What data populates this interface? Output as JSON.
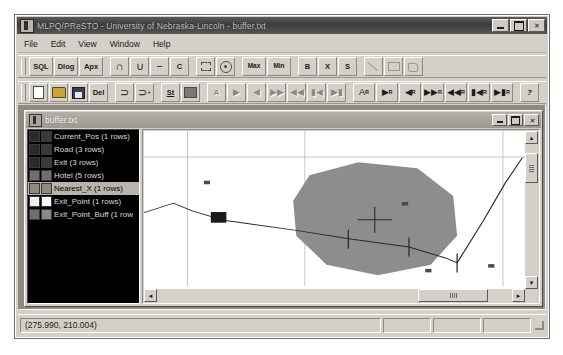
{
  "window": {
    "title": "MLPQ/PReSTO - University of Nebraska-Lincoln - buffer.txt",
    "icon": "app-icon",
    "controls": {
      "minimize": "",
      "maximize": "",
      "close": "✕"
    }
  },
  "menu": {
    "items": [
      "File",
      "Edit",
      "View",
      "Window",
      "Help"
    ]
  },
  "toolbar1": {
    "buttons": [
      {
        "label": "SQL",
        "name": "sql-button",
        "kind": "text",
        "wide": true,
        "disabled": false
      },
      {
        "label": "Dlog",
        "name": "datalog-button",
        "kind": "text",
        "wide": true,
        "disabled": false
      },
      {
        "label": "Apx",
        "name": "approximate-button",
        "kind": "text",
        "wide": true,
        "disabled": false
      },
      {
        "label": "∩",
        "name": "intersection-button",
        "kind": "sym",
        "wide": false,
        "disabled": false
      },
      {
        "label": "∪",
        "name": "union-button",
        "kind": "sym",
        "wide": false,
        "disabled": false
      },
      {
        "label": "−",
        "name": "difference-button",
        "kind": "sym",
        "wide": false,
        "disabled": false
      },
      {
        "label": "C",
        "name": "complement-button",
        "kind": "text",
        "wide": false,
        "disabled": false
      },
      {
        "label": "",
        "name": "select-area-icon",
        "kind": "sel",
        "wide": false,
        "disabled": false
      },
      {
        "label": "",
        "name": "point-circle-icon",
        "kind": "circ",
        "wide": false,
        "disabled": false
      },
      {
        "label": "Max",
        "name": "max-button",
        "kind": "sc",
        "wide": true,
        "disabled": false
      },
      {
        "label": "Min",
        "name": "min-button",
        "kind": "sc",
        "wide": true,
        "disabled": false
      },
      {
        "label": "B",
        "name": "buffer-button",
        "kind": "text",
        "wide": false,
        "disabled": false
      },
      {
        "label": "X",
        "name": "intersect-x-button",
        "kind": "text",
        "wide": false,
        "disabled": false
      },
      {
        "label": "S",
        "name": "shortest-path-button",
        "kind": "text",
        "wide": false,
        "disabled": false
      },
      {
        "label": "",
        "name": "line-tool-icon",
        "kind": "line",
        "wide": false,
        "disabled": true
      },
      {
        "label": "",
        "name": "rectangle-tool-icon",
        "kind": "rect",
        "wide": false,
        "disabled": true
      },
      {
        "label": "",
        "name": "polygon-tool-icon",
        "kind": "poly",
        "wide": false,
        "disabled": true
      }
    ],
    "separators_after": [
      2,
      6,
      8,
      10,
      13
    ]
  },
  "toolbar2": {
    "buttons": [
      {
        "label": "",
        "name": "new-file-icon",
        "kind": "doc",
        "sub": "",
        "disabled": false
      },
      {
        "label": "",
        "name": "open-file-icon",
        "kind": "open",
        "sub": "",
        "disabled": false
      },
      {
        "label": "",
        "name": "save-file-icon",
        "kind": "save",
        "sub": "",
        "disabled": false
      },
      {
        "label": "Del",
        "name": "delete-button",
        "kind": "text",
        "sub": "",
        "disabled": false
      },
      {
        "label": "⊃",
        "name": "curve-tool-icon",
        "kind": "curve",
        "sub": "",
        "disabled": false
      },
      {
        "label": "⊃",
        "name": "add-curve-tool-icon",
        "kind": "curve",
        "sub": "+",
        "disabled": false
      },
      {
        "label": "St",
        "name": "statistics-button",
        "kind": "under",
        "sub": "",
        "disabled": false
      },
      {
        "label": "",
        "name": "color-swatch-icon",
        "kind": "solid",
        "sub": "",
        "disabled": false
      },
      {
        "label": "A",
        "name": "animate-all-button",
        "kind": "text",
        "sub": "",
        "disabled": true
      },
      {
        "label": "▶",
        "name": "play-forward-button",
        "kind": "glyph",
        "sub": "",
        "disabled": true
      },
      {
        "label": "◀",
        "name": "play-backward-button",
        "kind": "glyph",
        "sub": "",
        "disabled": true
      },
      {
        "label": "▶▶",
        "name": "fast-forward-button",
        "kind": "glyph",
        "sub": "",
        "disabled": true
      },
      {
        "label": "◀◀",
        "name": "fast-rewind-button",
        "kind": "glyph",
        "sub": "",
        "disabled": true
      },
      {
        "label": "▮◀",
        "name": "skip-start-button",
        "kind": "glyph",
        "sub": "",
        "disabled": true
      },
      {
        "label": "▶▮",
        "name": "skip-end-button",
        "kind": "glyph",
        "sub": "",
        "disabled": true
      },
      {
        "label": "A",
        "name": "animate-all-rel-button",
        "kind": "rsub",
        "sub": "R",
        "disabled": false
      },
      {
        "label": "▶",
        "name": "play-forward-rel-button",
        "kind": "rsub",
        "sub": "R",
        "disabled": false
      },
      {
        "label": "◀",
        "name": "play-backward-rel-button",
        "kind": "rsub",
        "sub": "R",
        "disabled": false
      },
      {
        "label": "▶▶",
        "name": "fast-forward-rel-button",
        "kind": "rsub",
        "sub": "R",
        "disabled": false
      },
      {
        "label": "◀◀",
        "name": "fast-rewind-rel-button",
        "kind": "rsub",
        "sub": "R",
        "disabled": false
      },
      {
        "label": "▮◀",
        "name": "skip-start-rel-button",
        "kind": "rsub",
        "sub": "R",
        "disabled": false
      },
      {
        "label": "▶▮",
        "name": "skip-end-rel-button",
        "kind": "rsub",
        "sub": "R",
        "disabled": false
      },
      {
        "label": "?",
        "name": "help-button",
        "kind": "help",
        "sub": "",
        "disabled": false
      }
    ],
    "separators_after": [
      3,
      5,
      7,
      14,
      21
    ]
  },
  "child_window": {
    "title": "buffer.txt",
    "icon": "document-icon",
    "controls": {
      "minimize": "",
      "maximize": "",
      "close": "✕"
    }
  },
  "relations": [
    {
      "label": "Current_Pos (1 rows)",
      "swatch1": "#2a2a2a",
      "swatch2": "#3a3a3a",
      "selected": false
    },
    {
      "label": "Road (3 rows)",
      "swatch1": "#2a2a2a",
      "swatch2": "#3a3a3a",
      "selected": false
    },
    {
      "label": "Exit (3 rows)",
      "swatch1": "#2a2a2a",
      "swatch2": "#3a3a3a",
      "selected": false
    },
    {
      "label": "Hotel (5 rows)",
      "swatch1": "#6e6e6e",
      "swatch2": "#6e6e6e",
      "selected": false
    },
    {
      "label": "Nearest_X (1 rows)",
      "swatch1": "#8e8a82",
      "swatch2": "#8e8a82",
      "selected": true
    },
    {
      "label": "Exit_Point (1 rows)",
      "swatch1": "#f0f0f0",
      "swatch2": "#f8f8f8",
      "selected": false
    },
    {
      "label": "Exit_Point_Buff (1 row",
      "swatch1": "#6e6e6e",
      "swatch2": "#8a8a8a",
      "selected": false
    }
  ],
  "map": {
    "vscroll": {
      "up": "▲",
      "down": "▼"
    },
    "hscroll": {
      "left": "◄",
      "right": "►"
    },
    "buffer_fill": "#8d8d8d",
    "road_color": "#2a2a2a",
    "marker_color": "#1a1a1a",
    "grid_color": "#b9b9b9"
  },
  "map_geometry": {
    "buffer_polygon": "213,75 276,53 352,63 398,110 403,177 369,226 301,244 235,226 196,177 192,118",
    "road_polyline": "0,138 38,122 62,135 103,151 196,168 268,183 341,196 389,215 403,223 437,151 465,88 487,45",
    "road_ticks": [
      {
        "x": 263,
        "y": 183
      },
      {
        "x": 341,
        "y": 196
      },
      {
        "x": 403,
        "y": 223
      }
    ],
    "crosshair": {
      "x": 297,
      "y": 150,
      "size": 22
    },
    "big_marker": {
      "x": 86,
      "y": 137,
      "w": 20,
      "h": 18
    },
    "small_markers": [
      {
        "x": 81,
        "y": 87
      },
      {
        "x": 336,
        "y": 123
      },
      {
        "x": 366,
        "y": 236
      },
      {
        "x": 447,
        "y": 228
      },
      {
        "x": 506,
        "y": 253
      }
    ],
    "grid_h": [
      44
    ],
    "grid_v": [
      56,
      207,
      462
    ]
  },
  "status": {
    "coordinates": "(275.990, 210.004)",
    "panes": [
      "",
      "",
      ""
    ]
  }
}
